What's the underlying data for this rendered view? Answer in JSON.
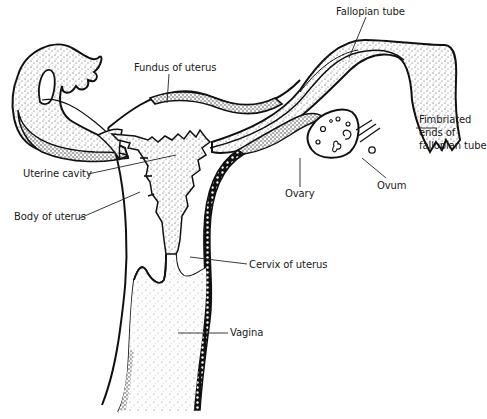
{
  "diagram": {
    "title": "",
    "colors": {
      "ink": "#111111",
      "stipple": "#333333",
      "background": "#ffffff"
    },
    "labels": [
      {
        "id": "fallopian-tube",
        "text": "Fallopian tube",
        "x": 336,
        "y": 5
      },
      {
        "id": "fundus-of-uterus",
        "text": "Fundus of uterus",
        "x": 134,
        "y": 61
      },
      {
        "id": "fimbriated-ends-line1",
        "text": "Fimbriated",
        "x": 419,
        "y": 113
      },
      {
        "id": "fimbriated-ends-line2",
        "text": "ends of",
        "x": 419,
        "y": 126
      },
      {
        "id": "fimbriated-ends-line3",
        "text": "fallopian tube",
        "x": 419,
        "y": 139
      },
      {
        "id": "uterine-cavity",
        "text": "Uterine cavity",
        "x": 23,
        "y": 167
      },
      {
        "id": "ovary",
        "text": "Ovary",
        "x": 285,
        "y": 187
      },
      {
        "id": "ovum",
        "text": "Ovum",
        "x": 377,
        "y": 179
      },
      {
        "id": "body-of-uterus",
        "text": "Body of uterus",
        "x": 14,
        "y": 210
      },
      {
        "id": "cervix-of-uterus",
        "text": "Cervix of uterus",
        "x": 249,
        "y": 258
      },
      {
        "id": "vagina",
        "text": "Vagina",
        "x": 230,
        "y": 326
      }
    ]
  }
}
